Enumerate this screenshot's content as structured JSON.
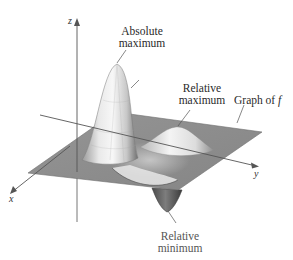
{
  "figure": {
    "axes": {
      "x_label": "x",
      "y_label": "y",
      "z_label": "z"
    },
    "annotations": {
      "absolute_max": {
        "line1": "Absolute",
        "line2": "maximum"
      },
      "relative_max": {
        "line1": "Relative",
        "line2": "maximum"
      },
      "relative_min": {
        "line1": "Relative",
        "line2": "minimum"
      },
      "graph_label": {
        "text": "Graph of ",
        "func": "f"
      }
    },
    "colors": {
      "plane": "#8f8f8f",
      "plane_edge": "#6e6e6e",
      "surface_light": "#f2f2f2",
      "surface_mid": "#bdbdbd",
      "surface_dark": "#5e5e5e",
      "axis": "#555555",
      "leader": "#555555"
    }
  }
}
